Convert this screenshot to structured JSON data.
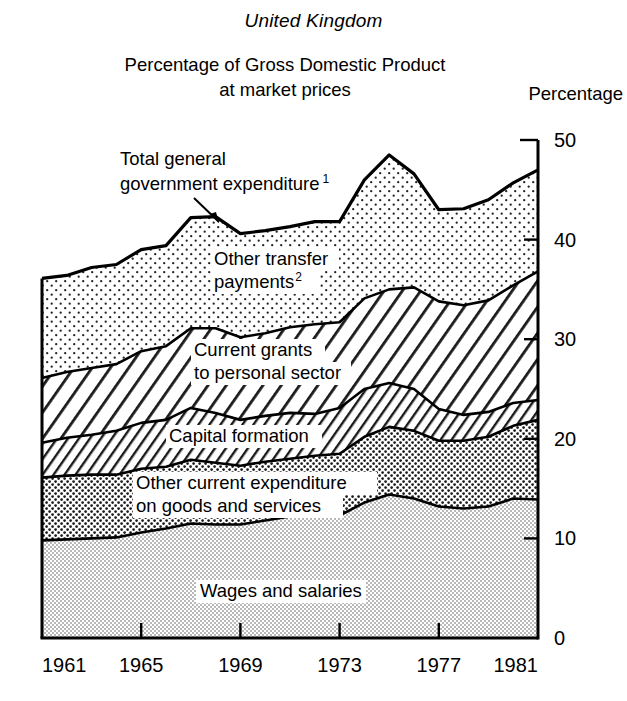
{
  "header": {
    "country": "United Kingdom",
    "subtitle_line1": "Percentage of Gross Domestic Product",
    "subtitle_line2": "at market prices",
    "unit_label": "Percentage"
  },
  "chart_data": {
    "type": "area",
    "stacked": true,
    "title": "Percentage of Gross Domestic Product at market prices",
    "subtitle": "United Kingdom",
    "xlabel": "",
    "ylabel": "Percentage",
    "xlim": [
      1961,
      1981
    ],
    "ylim": [
      0,
      50
    ],
    "ytick_labels": [
      "0",
      "10",
      "20",
      "30",
      "40",
      "50"
    ],
    "yticks": [
      0,
      10,
      20,
      30,
      40,
      50
    ],
    "xtick_labels": [
      "1961",
      "1965",
      "1969",
      "1973",
      "1977",
      "1981"
    ],
    "xticks": [
      1961,
      1965,
      1969,
      1973,
      1977,
      1981
    ],
    "grid": false,
    "legend_position": "inline-annotations",
    "x": [
      1961,
      1962,
      1963,
      1964,
      1965,
      1966,
      1967,
      1968,
      1969,
      1970,
      1971,
      1972,
      1973,
      1974,
      1975,
      1976,
      1977,
      1978,
      1979,
      1980,
      1981
    ],
    "series": [
      {
        "name": "Wages and salaries",
        "fill": "light-grey-stipple",
        "values": [
          9.8,
          9.9,
          10.0,
          10.1,
          10.6,
          11.0,
          11.5,
          11.4,
          11.4,
          11.8,
          12.2,
          12.4,
          12.3,
          13.6,
          14.4,
          14.0,
          13.2,
          13.0,
          13.2,
          14.0,
          13.9
        ]
      },
      {
        "name": "Other current expenditure on goods and services",
        "fill": "dark-dot-stipple",
        "values": [
          6.3,
          6.4,
          6.4,
          6.3,
          6.4,
          6.2,
          6.4,
          6.2,
          5.9,
          5.9,
          5.8,
          5.9,
          6.2,
          6.6,
          6.8,
          6.8,
          6.6,
          6.8,
          7.0,
          7.3,
          8.0
        ]
      },
      {
        "name": "Capital formation",
        "fill": "hatch-dense",
        "values": [
          3.5,
          3.8,
          4.0,
          4.4,
          4.6,
          4.7,
          5.2,
          5.0,
          4.6,
          4.6,
          4.6,
          4.2,
          4.6,
          4.8,
          4.4,
          4.2,
          3.2,
          2.6,
          2.5,
          2.3,
          2.0
        ]
      },
      {
        "name": "Current grants to personal sector",
        "fill": "hatch-wide",
        "values": [
          6.5,
          6.6,
          6.7,
          6.7,
          7.2,
          7.4,
          8.0,
          8.5,
          8.3,
          8.3,
          8.6,
          9.0,
          8.6,
          9.1,
          9.4,
          10.2,
          10.8,
          11.0,
          11.2,
          11.8,
          12.9
        ]
      },
      {
        "name": "Other transfer payments",
        "fill": "light-dot-stipple",
        "values": [
          10.0,
          9.7,
          10.1,
          10.0,
          10.2,
          10.1,
          11.1,
          11.2,
          10.4,
          10.3,
          10.1,
          10.3,
          10.1,
          11.9,
          13.5,
          11.4,
          9.2,
          9.7,
          10.1,
          10.3,
          10.2
        ]
      }
    ],
    "total_label": "Total general government expenditure",
    "totals": [
      36.1,
      36.4,
      37.2,
      37.5,
      39.0,
      39.4,
      42.2,
      42.3,
      40.6,
      40.9,
      41.3,
      41.8,
      41.8,
      46.0,
      48.5,
      46.6,
      43.0,
      43.1,
      44.0,
      45.7,
      47.0
    ]
  },
  "annotations": [
    {
      "id": "total-general-government-expenditure",
      "line1": "Total general",
      "line2": "government expenditure",
      "superscript": "1",
      "has_arrow": true
    },
    {
      "id": "other-transfer-payments",
      "line1": "Other transfer",
      "line2": "payments",
      "superscript": "2",
      "has_arrow": false
    },
    {
      "id": "current-grants-to-personal-sector",
      "line1": "Current grants",
      "line2": "to personal sector",
      "superscript": "",
      "has_arrow": false
    },
    {
      "id": "capital-formation",
      "line1": "Capital formation",
      "line2": "",
      "superscript": "",
      "has_arrow": false
    },
    {
      "id": "other-current-expenditure",
      "line1": "Other current expenditure",
      "line2": "on goods and services",
      "superscript": "",
      "has_arrow": false
    },
    {
      "id": "wages-and-salaries",
      "line1": "Wages and salaries",
      "line2": "",
      "superscript": "",
      "has_arrow": false
    }
  ]
}
